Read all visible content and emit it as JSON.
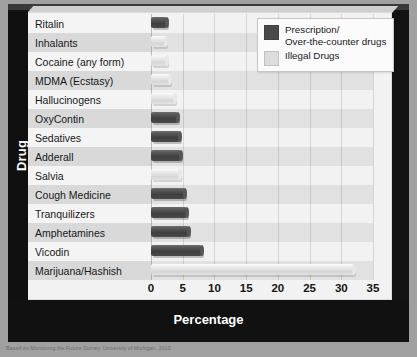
{
  "chart_data": {
    "type": "bar",
    "orientation": "horizontal",
    "title": "",
    "xlabel": "Percentage",
    "ylabel": "Drug",
    "xlim": [
      0,
      35
    ],
    "xticks": [
      "0",
      "5",
      "10",
      "15",
      "20",
      "25",
      "30",
      "35"
    ],
    "grid": true,
    "legend_position": "top-right",
    "categories": [
      "Ritalin",
      "Inhalants",
      "Cocaine (any form)",
      "MDMA (Ecstasy)",
      "Hallucinogens",
      "OxyContin",
      "Sedatives",
      "Adderall",
      "Salvia",
      "Cough Medicine",
      "Tranquilizers",
      "Amphetamines",
      "Vicodin",
      "Marijuana/Hashish"
    ],
    "values": [
      2.6,
      2.4,
      2.5,
      3.0,
      3.8,
      4.3,
      4.5,
      4.8,
      4.6,
      5.3,
      5.6,
      6.0,
      8.0,
      32.0
    ],
    "groups": [
      "prescription",
      "illegal",
      "illegal",
      "illegal",
      "illegal",
      "prescription",
      "prescription",
      "prescription",
      "illegal",
      "prescription",
      "prescription",
      "prescription",
      "prescription",
      "illegal"
    ],
    "series": [
      {
        "name": "Prescription/\nOver-the-counter drugs",
        "color": "#4a4a4a",
        "key": "prescription"
      },
      {
        "name": "Illegal Drugs",
        "color": "#dcdcdc",
        "key": "illegal"
      }
    ]
  },
  "legend": {
    "items": [
      {
        "label": "Prescription/\nOver-the-counter drugs",
        "swatch": "#4a4a4a"
      },
      {
        "label": "Illegal Drugs",
        "swatch": "#dcdcdc"
      }
    ]
  },
  "axes": {
    "y_title": "Drug",
    "x_title": "Percentage"
  },
  "footer": {
    "source": "Based on Monitoring the Future Survey, University of Michigan, 2010"
  }
}
